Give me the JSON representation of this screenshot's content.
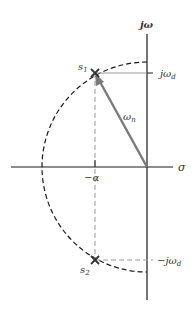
{
  "diagram": {
    "axes": {
      "imaginary_label": "jω",
      "real_label": "σ"
    },
    "points": {
      "s1": {
        "label": "s",
        "sub": "1"
      },
      "s2": {
        "label": "s",
        "sub": "2"
      }
    },
    "labels": {
      "jwd": {
        "prefix": "jω",
        "sub": "d"
      },
      "neg_jwd": {
        "prefix": "−jω",
        "sub": "d"
      },
      "wn": {
        "prefix": "ω",
        "sub": "n"
      },
      "neg_alpha": "−α"
    },
    "colors": {
      "axis": "#1a1a1a",
      "vector": "#7a7a7a",
      "guide": "#9a9a9a",
      "circle": "#1a1a1a"
    }
  }
}
